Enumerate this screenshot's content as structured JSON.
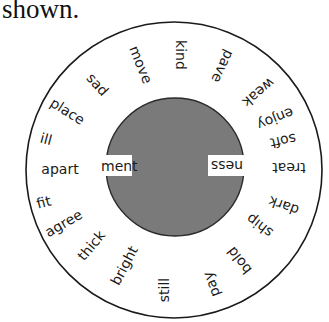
{
  "caption": "shown.",
  "wheel": {
    "center": {
      "x": 174,
      "y": 170
    },
    "outer_radius": 148,
    "inner_radius": 69,
    "outer_fill": "#ffffff",
    "inner_fill": "#7a7a7a",
    "stroke": "#1a1a1a",
    "inner_suffixes": [
      {
        "text": "ment",
        "side": "left"
      },
      {
        "text": "ness",
        "side": "right"
      }
    ],
    "words": [
      {
        "text": "kind",
        "x": 180,
        "y": 55,
        "rotate": 90
      },
      {
        "text": "pave",
        "x": 222,
        "y": 66,
        "rotate": 115
      },
      {
        "text": "weak",
        "x": 258,
        "y": 92,
        "rotate": 140
      },
      {
        "text": "enjoy",
        "x": 275,
        "y": 118,
        "rotate": 158
      },
      {
        "text": "soft",
        "x": 283,
        "y": 140,
        "rotate": 168
      },
      {
        "text": "treat",
        "x": 289,
        "y": 167,
        "rotate": 180
      },
      {
        "text": "dark",
        "x": 284,
        "y": 205,
        "rotate": 200
      },
      {
        "text": "ship",
        "x": 260,
        "y": 225,
        "rotate": 218
      },
      {
        "text": "bold",
        "x": 240,
        "y": 260,
        "rotate": 232
      },
      {
        "text": "pay",
        "x": 212,
        "y": 284,
        "rotate": 250
      },
      {
        "text": "still",
        "x": 165,
        "y": 290,
        "rotate": -90
      },
      {
        "text": "bright",
        "x": 125,
        "y": 266,
        "rotate": -62
      },
      {
        "text": "thick",
        "x": 92,
        "y": 246,
        "rotate": -50
      },
      {
        "text": "agree",
        "x": 64,
        "y": 224,
        "rotate": -30
      },
      {
        "text": "fit",
        "x": 44,
        "y": 203,
        "rotate": -15
      },
      {
        "text": "apart",
        "x": 60,
        "y": 170,
        "rotate": 0
      },
      {
        "text": "ill",
        "x": 46,
        "y": 140,
        "rotate": 15
      },
      {
        "text": "place",
        "x": 67,
        "y": 112,
        "rotate": 32
      },
      {
        "text": "sad",
        "x": 97,
        "y": 85,
        "rotate": 48
      },
      {
        "text": "move",
        "x": 140,
        "y": 65,
        "rotate": 68
      }
    ]
  }
}
